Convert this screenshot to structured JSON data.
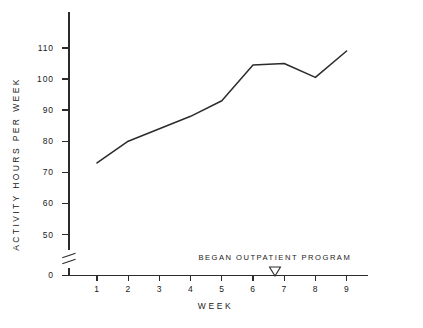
{
  "chart_data": {
    "type": "line",
    "title": "",
    "subtitle": "",
    "xlabel": "WEEK",
    "ylabel": "ACTIVITY HOURS PER WEEK",
    "x": [
      1,
      2,
      3,
      4,
      5,
      6,
      7,
      8,
      9
    ],
    "values": [
      73,
      80,
      84,
      88,
      93,
      104.5,
      105,
      100.5,
      109
    ],
    "series": [
      {
        "name": "Activity hours per week",
        "values": [
          73,
          80,
          84,
          88,
          93,
          104.5,
          105,
          100.5,
          109
        ]
      }
    ],
    "xtick_labels": [
      "1",
      "2",
      "3",
      "4",
      "5",
      "6",
      "7",
      "8",
      "9"
    ],
    "ytick_labels": [
      "0",
      "50",
      "60",
      "70",
      "80",
      "90",
      "100",
      "110"
    ],
    "ytick_values": [
      0,
      50,
      60,
      70,
      80,
      90,
      100,
      110
    ],
    "ylim": [
      50,
      114
    ],
    "xlim": [
      0.45,
      9.7
    ],
    "axis_break": true,
    "axis_break_between": [
      0,
      50
    ],
    "grid": false,
    "legend": false,
    "legend_position": "none",
    "line_color": "#2b2b2b",
    "axis_color": "#2b2b2b",
    "markers": false,
    "annotations": [
      {
        "text": "BEGAN  OUTPATIENT  PROGRAM",
        "marker": "down-triangle-outline",
        "x": 6.7,
        "y": 50
      }
    ]
  }
}
